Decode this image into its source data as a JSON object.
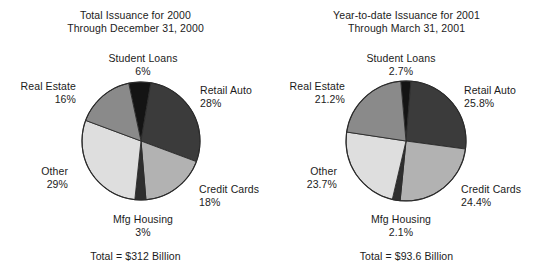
{
  "chart_data": [
    {
      "type": "pie",
      "title": "Total Issuance for 2000",
      "subtitle": "Through December 31, 2000",
      "categories": [
        "Student Loans",
        "Retail Auto",
        "Credit Cards",
        "Mfg Housing",
        "Other",
        "Real Estate"
      ],
      "values": [
        6,
        28,
        18,
        3,
        29,
        16
      ],
      "value_labels": [
        "6%",
        "28%",
        "18%",
        "3%",
        "29%",
        "16%"
      ],
      "colors": [
        "#141414",
        "#3b3b3b",
        "#b2b2b2",
        "#2e2e2e",
        "#dedede",
        "#8a8a8a"
      ],
      "footnote": "Total = $312 Billion",
      "legend": "none",
      "grid": false,
      "start_angle_deg": -12,
      "slices": [
        {
          "label": "Student Loans",
          "value": 6,
          "value_label": "6%",
          "color": "#141414"
        },
        {
          "label": "Retail Auto",
          "value": 28,
          "value_label": "28%",
          "color": "#3b3b3b"
        },
        {
          "label": "Credit Cards",
          "value": 18,
          "value_label": "18%",
          "color": "#b2b2b2"
        },
        {
          "label": "Mfg Housing",
          "value": 3,
          "value_label": "3%",
          "color": "#2e2e2e"
        },
        {
          "label": "Other",
          "value": 29,
          "value_label": "29%",
          "color": "#dedede"
        },
        {
          "label": "Real Estate",
          "value": 16,
          "value_label": "16%",
          "color": "#8a8a8a"
        }
      ]
    },
    {
      "type": "pie",
      "title": "Year-to-date Issuance for 2001",
      "subtitle": "Through March 31, 2001",
      "categories": [
        "Student Loans",
        "Retail Auto",
        "Credit Cards",
        "Mfg Housing",
        "Other",
        "Real Estate"
      ],
      "values": [
        2.7,
        25.8,
        24.4,
        2.1,
        23.7,
        21.2
      ],
      "value_labels": [
        "2.7%",
        "25.8%",
        "24.4%",
        "2.1%",
        "23.7%",
        "21.2%"
      ],
      "colors": [
        "#141414",
        "#3b3b3b",
        "#b2b2b2",
        "#2e2e2e",
        "#dedede",
        "#8a8a8a"
      ],
      "footnote": "Total = $93.6 Billion",
      "legend": "none",
      "grid": false,
      "start_angle_deg": -5,
      "slices": [
        {
          "label": "Student Loans",
          "value": 2.7,
          "value_label": "2.7%",
          "color": "#141414"
        },
        {
          "label": "Retail Auto",
          "value": 25.8,
          "value_label": "25.8%",
          "color": "#3b3b3b"
        },
        {
          "label": "Credit Cards",
          "value": 24.4,
          "value_label": "24.4%",
          "color": "#b2b2b2"
        },
        {
          "label": "Mfg Housing",
          "value": 2.1,
          "value_label": "2.1%",
          "color": "#2e2e2e"
        },
        {
          "label": "Other",
          "value": 23.7,
          "value_label": "23.7%",
          "color": "#dedede"
        },
        {
          "label": "Real Estate",
          "value": 21.2,
          "value_label": "21.2%",
          "color": "#8a8a8a"
        }
      ]
    }
  ],
  "left": {
    "title": "Total Issuance for 2000",
    "subtitle": "Through December 31, 2000",
    "labels": {
      "student_loans": "Student Loans",
      "student_loans_value": "6%",
      "retail_auto": "Retail Auto",
      "retail_auto_value": "28%",
      "credit_cards": "Credit Cards",
      "credit_cards_value": "18%",
      "mfg_housing": "Mfg Housing",
      "mfg_housing_value": "3%",
      "other": "Other",
      "other_value": "29%",
      "real_estate": "Real Estate",
      "real_estate_value": "16%"
    },
    "total": "Total = $312 Billion"
  },
  "right": {
    "title": "Year-to-date Issuance for 2001",
    "subtitle": "Through March 31, 2001",
    "labels": {
      "student_loans": "Student Loans",
      "student_loans_value": "2.7%",
      "retail_auto": "Retail Auto",
      "retail_auto_value": "25.8%",
      "credit_cards": "Credit Cards",
      "credit_cards_value": "24.4%",
      "mfg_housing": "Mfg Housing",
      "mfg_housing_value": "2.1%",
      "other": "Other",
      "other_value": "23.7%",
      "real_estate": "Real Estate",
      "real_estate_value": "21.2%"
    },
    "total": "Total = $93.6 Billion"
  },
  "palette": {
    "student_loans": "#141414",
    "retail_auto": "#3b3b3b",
    "credit_cards": "#b2b2b2",
    "mfg_housing": "#2e2e2e",
    "other": "#dedede",
    "real_estate": "#8a8a8a",
    "outline": "#2a2a2a",
    "background": "#ffffff",
    "text": "#1b1b1b"
  }
}
